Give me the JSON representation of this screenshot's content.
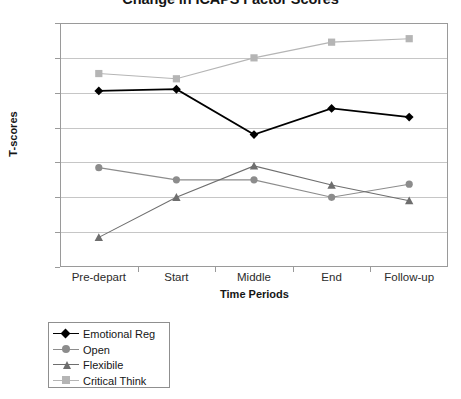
{
  "chart_data": {
    "type": "line",
    "title": "Change in ICAPS Factor Scores",
    "xlabel": "Time Periods",
    "ylabel": "T-scores",
    "categories": [
      "Pre-depart",
      "Start",
      "Middle",
      "End",
      "Follow-up"
    ],
    "ylim": [
      44,
      58
    ],
    "yticks": [
      44,
      46,
      48,
      50,
      52,
      54,
      56,
      58
    ],
    "grid": true,
    "legend_position": "below-left",
    "series": [
      {
        "name": "Emotional Reg",
        "color": "#000000",
        "marker": "diamond",
        "values": [
          54.1,
          54.2,
          51.6,
          53.1,
          52.6
        ]
      },
      {
        "name": "Open",
        "color": "#8c8c8c",
        "marker": "circle",
        "values": [
          49.7,
          49.0,
          49.0,
          48.0,
          48.75
        ]
      },
      {
        "name": "Flexibile",
        "color": "#6e6e6e",
        "marker": "triangle",
        "values": [
          45.7,
          48.0,
          49.8,
          48.7,
          47.8
        ]
      },
      {
        "name": "Critical Think",
        "color": "#b5b5b5",
        "marker": "square",
        "values": [
          55.1,
          54.8,
          56.0,
          56.9,
          57.1
        ]
      }
    ]
  }
}
